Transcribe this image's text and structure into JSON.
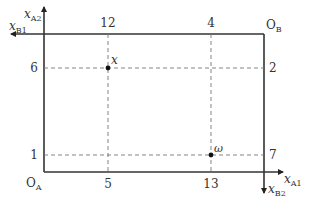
{
  "diagram": {
    "type": "edgeworth_box",
    "origins": {
      "A": {
        "label": "O",
        "sub": "A"
      },
      "B": {
        "label": "O",
        "sub": "B"
      }
    },
    "axes": {
      "xA1": {
        "label": "x",
        "sub": "A1"
      },
      "xA2": {
        "label": "x",
        "sub": "A2"
      },
      "xB1": {
        "label": "x",
        "sub": "B1"
      },
      "xB2": {
        "label": "x",
        "sub": "B2"
      }
    },
    "ticks": {
      "bottom": [
        "5",
        "13"
      ],
      "top": [
        "12",
        "4"
      ],
      "left": [
        "6",
        "1"
      ],
      "right": [
        "2",
        "7"
      ]
    },
    "points": [
      {
        "name": "x",
        "label": "x",
        "xA1": 5,
        "xA2": 6,
        "xB1": 12,
        "xB2": 2
      },
      {
        "name": "omega",
        "label": "ω",
        "xA1": 13,
        "xA2": 1,
        "xB1": 4,
        "xB2": 7
      }
    ],
    "box": {
      "width_total_good1": 17,
      "height_total_good2": 8
    }
  }
}
